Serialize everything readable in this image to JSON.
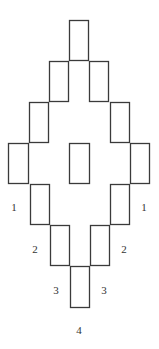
{
  "diagram": {
    "stroke_color": "#3a3a3a",
    "background": "#ffffff",
    "rects": [
      {
        "id": "r1",
        "x": 69,
        "y": 20,
        "w": 19,
        "h": 40
      },
      {
        "id": "r2",
        "x": 49,
        "y": 61,
        "w": 19,
        "h": 40
      },
      {
        "id": "r3",
        "x": 89,
        "y": 61,
        "w": 19,
        "h": 40
      },
      {
        "id": "r4",
        "x": 29,
        "y": 102,
        "w": 19,
        "h": 40
      },
      {
        "id": "r5",
        "x": 110,
        "y": 102,
        "w": 19,
        "h": 40
      },
      {
        "id": "r6",
        "x": 8,
        "y": 143,
        "w": 20,
        "h": 40
      },
      {
        "id": "r7",
        "x": 69,
        "y": 143,
        "w": 20,
        "h": 40
      },
      {
        "id": "r8",
        "x": 130,
        "y": 143,
        "w": 19,
        "h": 40
      },
      {
        "id": "r9",
        "x": 30,
        "y": 184,
        "w": 19,
        "h": 40
      },
      {
        "id": "r10",
        "x": 110,
        "y": 184,
        "w": 19,
        "h": 40
      },
      {
        "id": "r11",
        "x": 50,
        "y": 225,
        "w": 19,
        "h": 40
      },
      {
        "id": "r12",
        "x": 90,
        "y": 225,
        "w": 19,
        "h": 40
      },
      {
        "id": "r13",
        "x": 70,
        "y": 266,
        "w": 19,
        "h": 41
      }
    ],
    "labels": [
      {
        "id": "label-1-left",
        "text": "1",
        "x": 14,
        "y": 211
      },
      {
        "id": "label-1-right",
        "text": "1",
        "x": 144,
        "y": 211
      },
      {
        "id": "label-2-left",
        "text": "2",
        "x": 35,
        "y": 253
      },
      {
        "id": "label-2-right",
        "text": "2",
        "x": 124,
        "y": 253
      },
      {
        "id": "label-3-left",
        "text": "3",
        "x": 56,
        "y": 294
      },
      {
        "id": "label-3-right",
        "text": "3",
        "x": 104,
        "y": 294
      },
      {
        "id": "label-4",
        "text": "4",
        "x": 79,
        "y": 334
      }
    ]
  }
}
